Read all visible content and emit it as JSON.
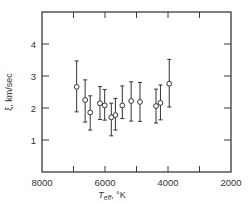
{
  "chart_data": {
    "type": "scatter",
    "title": "",
    "xlabel": "T_eff, °K",
    "xlabel_main": "T",
    "xlabel_sub": "eff",
    "xlabel_unit": ", °K",
    "ylabel": "ξ, km/sec",
    "xlim": [
      8000,
      2000
    ],
    "ylim": [
      0,
      5
    ],
    "x_reversed": true,
    "x_ticks": [
      8000,
      6000,
      4000,
      2000
    ],
    "x_tick_labels": [
      "8000",
      "6000",
      "4000",
      "2000"
    ],
    "x_minor_ticks": [
      7000,
      5000,
      3000
    ],
    "y_ticks": [
      1,
      2,
      3,
      4
    ],
    "y_tick_labels": [
      "1",
      "2",
      "3",
      "4"
    ],
    "grid": false,
    "legend": null,
    "marker": "open-circle",
    "error_bars": true,
    "series": [
      {
        "name": "microturbulence",
        "points": [
          {
            "x": 6900,
            "y": 2.66,
            "ylow": 1.88,
            "yhigh": 3.47
          },
          {
            "x": 6630,
            "y": 2.25,
            "ylow": 1.56,
            "yhigh": 2.88
          },
          {
            "x": 6470,
            "y": 1.86,
            "ylow": 1.31,
            "yhigh": 2.38
          },
          {
            "x": 6160,
            "y": 2.15,
            "ylow": 1.64,
            "yhigh": 2.67
          },
          {
            "x": 6010,
            "y": 2.08,
            "ylow": 1.62,
            "yhigh": 2.58
          },
          {
            "x": 5800,
            "y": 1.71,
            "ylow": 1.13,
            "yhigh": 2.15
          },
          {
            "x": 5670,
            "y": 1.78,
            "ylow": 1.31,
            "yhigh": 2.3
          },
          {
            "x": 5450,
            "y": 2.08,
            "ylow": 1.67,
            "yhigh": 2.69
          },
          {
            "x": 5170,
            "y": 2.22,
            "ylow": 1.59,
            "yhigh": 2.82
          },
          {
            "x": 4890,
            "y": 2.19,
            "ylow": 1.58,
            "yhigh": 2.8
          },
          {
            "x": 4380,
            "y": 2.06,
            "ylow": 1.53,
            "yhigh": 2.59
          },
          {
            "x": 4240,
            "y": 2.16,
            "ylow": 1.63,
            "yhigh": 2.72
          },
          {
            "x": 3960,
            "y": 2.76,
            "ylow": 2.03,
            "yhigh": 3.52
          }
        ]
      }
    ]
  },
  "colors": {
    "axis": "#3a3a3a",
    "marker_fill": "#ffffff",
    "marker_stroke": "#333333",
    "background": "#ffffff"
  }
}
